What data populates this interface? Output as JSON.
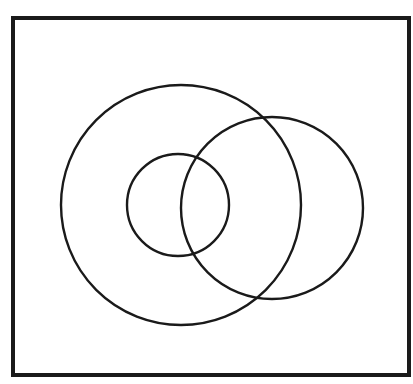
{
  "figure": {
    "canvas": {
      "width": 413,
      "height": 384,
      "background": "#ffffff"
    },
    "stroke_color": "#1a1a1a",
    "frame": {
      "name": "rectangular-border",
      "x": 13,
      "y": 18,
      "width": 396,
      "height": 357,
      "stroke_width": 4,
      "fill": "none"
    },
    "shapes": [
      {
        "id": "large-circle",
        "label": "large left circle",
        "cx": 181,
        "cy": 205,
        "r": 120,
        "stroke_width": 2.4,
        "fill": "none"
      },
      {
        "id": "right-circle",
        "label": "right circle",
        "cx": 272,
        "cy": 208,
        "r": 91,
        "stroke_width": 2.4,
        "fill": "none"
      },
      {
        "id": "small-circle",
        "label": "small inner circle",
        "cx": 178,
        "cy": 205,
        "r": 51,
        "stroke_width": 2.4,
        "fill": "none"
      }
    ]
  },
  "chart_data": {
    "type": "diagram",
    "subtitle": "",
    "xlabel": "",
    "ylabel": "",
    "grid": false,
    "legend": "none",
    "annotations": [],
    "coordinate_space": {
      "x": [
        0,
        413
      ],
      "y": [
        0,
        384
      ],
      "units": "pixels"
    },
    "elements": [
      {
        "type": "rectangle",
        "name": "frame",
        "x": 13,
        "y": 18,
        "width": 396,
        "height": 357,
        "stroke": "#1a1a1a",
        "stroke_width": 4,
        "fill": "none"
      },
      {
        "type": "circle",
        "name": "large-circle",
        "cx": 181,
        "cy": 205,
        "r": 120,
        "stroke": "#1a1a1a",
        "stroke_width": 2.4,
        "fill": "none"
      },
      {
        "type": "circle",
        "name": "right-circle",
        "cx": 272,
        "cy": 208,
        "r": 91,
        "stroke": "#1a1a1a",
        "stroke_width": 2.4,
        "fill": "none"
      },
      {
        "type": "circle",
        "name": "small-circle",
        "cx": 178,
        "cy": 205,
        "r": 51,
        "stroke": "#1a1a1a",
        "stroke_width": 2.4,
        "fill": "none"
      }
    ],
    "relationships": [
      "large-circle and right-circle intersect at two points (upper-right and lower-right)",
      "small-circle lies inside large-circle",
      "small-circle and right-circle intersect at two points",
      "all three circles are contained within the frame"
    ]
  }
}
